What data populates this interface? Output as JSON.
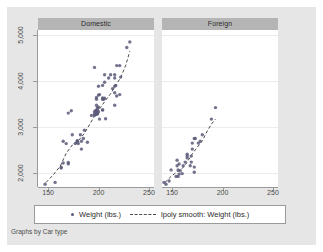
{
  "figure": {
    "note": "Graphs by Car type",
    "bg_color": "#e6e6e6",
    "panel_bg": "#ffffff",
    "panel_header_bg": "#b5b5b5",
    "marker_color": "#5a5a7a",
    "line_color": "#4a4a4a"
  },
  "legend": {
    "marker_label": "Weight (lbs.)",
    "line_label": "lpoly smooth: Weight (lbs.)"
  },
  "chart_data": {
    "type": "scatter",
    "title": "",
    "xlabel": "",
    "ylabel": "",
    "xlim": [
      140,
      255
    ],
    "ylim": [
      1700,
      5100
    ],
    "grid": true,
    "legend_position": "bottom",
    "xticks": [
      150,
      200,
      250
    ],
    "xtick_labels": [
      "150",
      "200",
      "250"
    ],
    "yticks": [
      2000,
      3000,
      4000,
      5000
    ],
    "ytick_labels": [
      "2,000",
      "3,000",
      "4,000",
      "5,000"
    ],
    "panels": [
      {
        "name": "Domestic",
        "points": [
          [
            186,
            2930
          ],
          [
            173,
            3350
          ],
          [
            168,
            2640
          ],
          [
            196,
            3250
          ],
          [
            222,
            4080
          ],
          [
            218,
            3670
          ],
          [
            170,
            2230
          ],
          [
            199,
            3280
          ],
          [
            200,
            3880
          ],
          [
            221,
            4330
          ],
          [
            204,
            3900
          ],
          [
            196,
            4290
          ],
          [
            199,
            3370
          ],
          [
            218,
            4330
          ],
          [
            170,
            3300
          ],
          [
            200,
            3690
          ],
          [
            207,
            3180
          ],
          [
            221,
            3700
          ],
          [
            204,
            3370
          ],
          [
            212,
            4130
          ],
          [
            163,
            2110
          ],
          [
            157,
            1800
          ],
          [
            206,
            3620
          ],
          [
            205,
            3600
          ],
          [
            204,
            3600
          ],
          [
            196,
            3330
          ],
          [
            198,
            3370
          ],
          [
            206,
            4130
          ],
          [
            201,
            3700
          ],
          [
            216,
            3470
          ],
          [
            198,
            3600
          ],
          [
            216,
            4130
          ],
          [
            182,
            2830
          ],
          [
            193,
            3250
          ],
          [
            179,
            2700
          ],
          [
            216,
            3880
          ],
          [
            198,
            3470
          ],
          [
            198,
            3640
          ],
          [
            174,
            2830
          ],
          [
            170,
            2200
          ],
          [
            165,
            2690
          ],
          [
            163,
            2130
          ],
          [
            179,
            2670
          ],
          [
            201,
            3170
          ],
          [
            189,
            2670
          ],
          [
            197,
            3350
          ],
          [
            199,
            3310
          ],
          [
            204,
            3370
          ],
          [
            216,
            4060
          ],
          [
            165,
            2220
          ],
          [
            185,
            2750
          ],
          [
            196,
            3280
          ],
          [
            200,
            3430
          ],
          [
            198,
            3280
          ],
          [
            204,
            3630
          ],
          [
            217,
            3900
          ],
          [
            231,
            4840
          ],
          [
            228,
            4720
          ],
          [
            214,
            3830
          ],
          [
            198,
            3280
          ],
          [
            199,
            3420
          ],
          [
            206,
            3970
          ],
          [
            180,
            2640
          ],
          [
            147,
            1760
          ],
          [
            183,
            2520
          ],
          [
            177,
            2640
          ],
          [
            200,
            3330
          ],
          [
            216,
            3740
          ],
          [
            210,
            4060
          ],
          [
            179,
            2690
          ],
          [
            198,
            3310
          ],
          [
            183,
            2690
          ]
        ],
        "smooth": [
          [
            148,
            1800
          ],
          [
            155,
            1960
          ],
          [
            162,
            2150
          ],
          [
            168,
            2430
          ],
          [
            174,
            2610
          ],
          [
            180,
            2700
          ],
          [
            186,
            2860
          ],
          [
            192,
            3090
          ],
          [
            197,
            3270
          ],
          [
            202,
            3420
          ],
          [
            207,
            3580
          ],
          [
            212,
            3720
          ],
          [
            217,
            3900
          ],
          [
            222,
            4070
          ],
          [
            227,
            4340
          ],
          [
            231,
            4640
          ]
        ]
      },
      {
        "name": "Foreign",
        "points": [
          [
            149,
            2070
          ],
          [
            142,
            1800
          ],
          [
            155,
            2280
          ],
          [
            157,
            2200
          ],
          [
            165,
            2330
          ],
          [
            170,
            2520
          ],
          [
            163,
            2240
          ],
          [
            172,
            2750
          ],
          [
            170,
            2650
          ],
          [
            155,
            2160
          ],
          [
            156,
            1930
          ],
          [
            165,
            2370
          ],
          [
            169,
            2370
          ],
          [
            160,
            1990
          ],
          [
            156,
            2070
          ],
          [
            172,
            2130
          ],
          [
            168,
            2160
          ],
          [
            176,
            2650
          ],
          [
            178,
            2690
          ],
          [
            180,
            2830
          ],
          [
            165,
            2410
          ],
          [
            193,
            3420
          ],
          [
            189,
            3170
          ],
          [
            154,
            1930
          ],
          [
            147,
            1830
          ],
          [
            172,
            2020
          ],
          [
            173,
            2750
          ],
          [
            158,
            2050
          ],
          [
            161,
            2160
          ],
          [
            169,
            2240
          ],
          [
            157,
            1980
          ],
          [
            144,
            1760
          ]
        ],
        "smooth": [
          [
            143,
            1800
          ],
          [
            149,
            1930
          ],
          [
            155,
            2030
          ],
          [
            160,
            2100
          ],
          [
            165,
            2240
          ],
          [
            170,
            2420
          ],
          [
            175,
            2560
          ],
          [
            180,
            2700
          ],
          [
            185,
            2920
          ],
          [
            189,
            3060
          ],
          [
            193,
            3170
          ]
        ]
      }
    ]
  }
}
